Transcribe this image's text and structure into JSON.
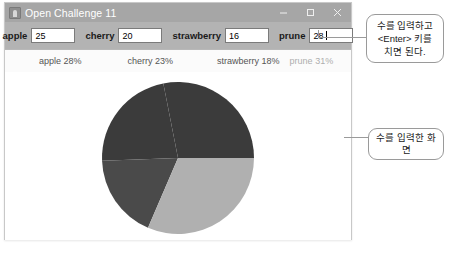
{
  "window": {
    "title": "Open Challenge 11",
    "icon": "app-icon",
    "controls": {
      "minimize": "minimize-icon",
      "maximize": "maximize-icon",
      "close": "close-icon"
    }
  },
  "toolbar": {
    "fields": [
      {
        "label": "apple",
        "value": "25",
        "focused": false
      },
      {
        "label": "cherry",
        "value": "20",
        "focused": false
      },
      {
        "label": "strawberry",
        "value": "16",
        "focused": false
      },
      {
        "label": "prune",
        "value": "28",
        "focused": true
      }
    ]
  },
  "percent_row": {
    "apple": "apple 28%",
    "cherry": "cherry 23%",
    "strawberry": "strawberry 18%",
    "prune": "prune 31%"
  },
  "annotations": {
    "enter_hint": "수를 입력하고\n<Enter> 키를\n치면 된다.",
    "screen_hint": "수를 입력한 화면"
  },
  "chart_data": {
    "type": "pie",
    "title": "",
    "categories": [
      "apple",
      "cherry",
      "strawberry",
      "prune"
    ],
    "values": [
      25,
      20,
      16,
      28
    ],
    "percents": [
      28,
      23,
      18,
      31
    ],
    "colors": [
      "#3b3b3b",
      "#3b3b3b",
      "#4a4a4a",
      "#b0b0b0"
    ],
    "legend": "top",
    "start_angle": 0,
    "radius": 74,
    "center": [
      176,
      84
    ]
  }
}
